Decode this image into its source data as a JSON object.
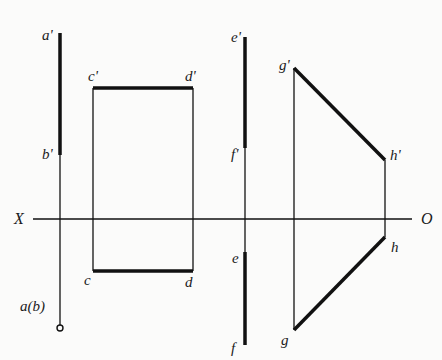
{
  "diagram": {
    "colors": {
      "line": "#111111",
      "background": "#fbfbfa"
    },
    "axis": {
      "label_left": "X",
      "label_right": "O"
    },
    "labels": {
      "a_prime": "a'",
      "b_prime": "b'",
      "ab": "a(b)",
      "c_prime": "c'",
      "d_prime": "d'",
      "c": "c",
      "d": "d",
      "e_prime": "e'",
      "f_prime": "f'",
      "e": "e",
      "f": "f",
      "g_prime": "g'",
      "h_prime": "h'",
      "g": "g",
      "h": "h"
    }
  }
}
